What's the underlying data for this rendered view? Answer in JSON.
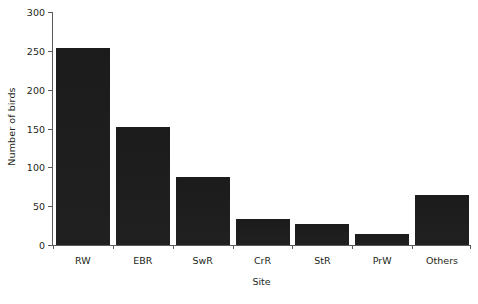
{
  "chart_data": {
    "type": "bar",
    "title": "",
    "xlabel": "Site",
    "ylabel": "Number of birds",
    "categories": [
      "RW",
      "EBR",
      "SwR",
      "CrR",
      "StR",
      "PrW",
      "Others"
    ],
    "values": [
      254,
      152,
      88,
      33,
      27,
      14,
      64
    ],
    "ylim": [
      0,
      300
    ],
    "yticks": [
      0,
      50,
      100,
      150,
      200,
      250,
      300
    ],
    "ytick_labels": [
      "0",
      "50",
      "100",
      "150",
      "200",
      "250",
      "300"
    ],
    "grid": false,
    "legend": null,
    "bar_color": "#1c1c1c",
    "axis_color": "#58595b",
    "text_color": "#231f20",
    "background_color": "#ffffff"
  }
}
